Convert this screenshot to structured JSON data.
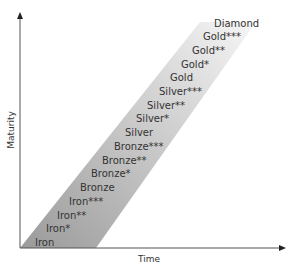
{
  "diagram": {
    "x_axis_label": "Time",
    "y_axis_label": "Maturity",
    "colors": {
      "band_dark": "#9a9a9a",
      "band_light": "#f4f4f4",
      "axis": "#555555",
      "text": "#333333"
    },
    "levels": [
      "Iron",
      "Iron*",
      "Iron**",
      "Iron***",
      "Bronze",
      "Bronze*",
      "Bronze**",
      "Bronze***",
      "Silver",
      "Silver*",
      "Silver**",
      "Silver***",
      "Gold",
      "Gold*",
      "Gold**",
      "Gold***",
      "Diamond"
    ]
  },
  "caption": ""
}
